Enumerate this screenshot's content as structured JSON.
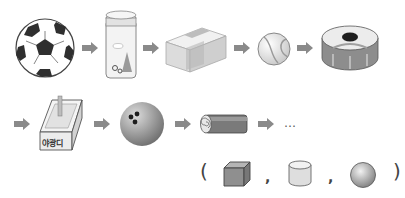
{
  "sequence": {
    "row1": [
      {
        "item": "soccer-ball",
        "shape": "sphere"
      },
      {
        "item": "jar",
        "shape": "cylinder"
      },
      {
        "item": "eraser",
        "shape": "cuboid"
      },
      {
        "item": "marble",
        "shape": "sphere"
      },
      {
        "item": "tape-roll",
        "shape": "cylinder"
      }
    ],
    "row2": [
      {
        "item": "candy-box",
        "shape": "cuboid",
        "label": "야광디"
      },
      {
        "item": "bowling-ball",
        "shape": "sphere"
      },
      {
        "item": "rolled-log",
        "shape": "cylinder"
      }
    ],
    "continuation": "…"
  },
  "answer_choices": {
    "open_paren": "(",
    "close_paren": ")",
    "separator": ",",
    "options": [
      "cube",
      "cylinder",
      "sphere"
    ]
  },
  "colors": {
    "arrow": "#8a8a8a",
    "outline": "#555555",
    "light_gray": "#e4e4e4",
    "mid_gray": "#b5b5b5",
    "dark_gray": "#2e2e2e"
  }
}
